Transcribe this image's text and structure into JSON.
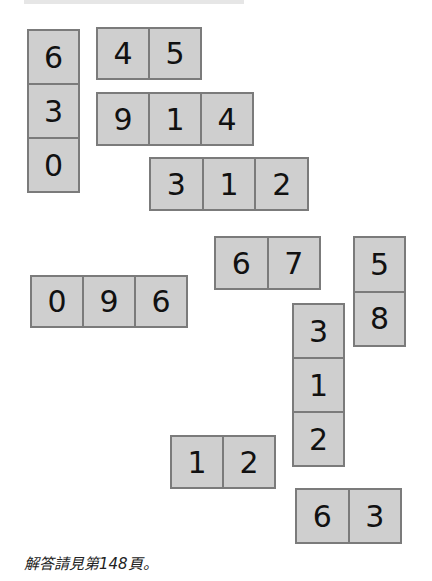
{
  "colors": {
    "tile_fill": "#cfcfcf",
    "tile_border": "#7b7b7b",
    "digit": "#111111"
  },
  "pieces": [
    {
      "id": "p630",
      "orientation": "vertical",
      "digits": [
        "6",
        "3",
        "0"
      ],
      "x": 27,
      "y": 29,
      "w": 53,
      "h": 164
    },
    {
      "id": "p45",
      "orientation": "horizontal",
      "digits": [
        "4",
        "5"
      ],
      "x": 96,
      "y": 27,
      "w": 106,
      "h": 53
    },
    {
      "id": "p914",
      "orientation": "horizontal",
      "digits": [
        "9",
        "1",
        "4"
      ],
      "x": 96,
      "y": 92,
      "w": 158,
      "h": 54
    },
    {
      "id": "p312h",
      "orientation": "horizontal",
      "digits": [
        "3",
        "1",
        "2"
      ],
      "x": 149,
      "y": 157,
      "w": 160,
      "h": 54
    },
    {
      "id": "p67",
      "orientation": "horizontal",
      "digits": [
        "6",
        "7"
      ],
      "x": 214,
      "y": 236,
      "w": 107,
      "h": 54
    },
    {
      "id": "p58",
      "orientation": "vertical",
      "digits": [
        "5",
        "8"
      ],
      "x": 353,
      "y": 236,
      "w": 53,
      "h": 111
    },
    {
      "id": "p096",
      "orientation": "horizontal",
      "digits": [
        "0",
        "9",
        "6"
      ],
      "x": 30,
      "y": 275,
      "w": 158,
      "h": 53
    },
    {
      "id": "p312v",
      "orientation": "vertical",
      "digits": [
        "3",
        "1",
        "2"
      ],
      "x": 292,
      "y": 303,
      "w": 53,
      "h": 164
    },
    {
      "id": "p12",
      "orientation": "horizontal",
      "digits": [
        "1",
        "2"
      ],
      "x": 170,
      "y": 435,
      "w": 106,
      "h": 54
    },
    {
      "id": "p63",
      "orientation": "horizontal",
      "digits": [
        "6",
        "3"
      ],
      "x": 295,
      "y": 488,
      "w": 107,
      "h": 56
    }
  ],
  "caption": "解答請見第148頁。"
}
